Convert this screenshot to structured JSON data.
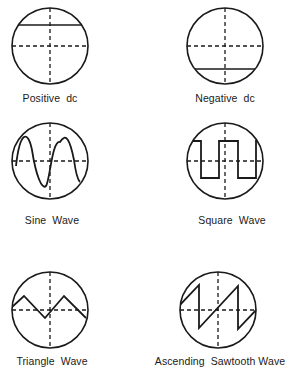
{
  "figure": {
    "panels": [
      {
        "id": "positive-dc",
        "label": "Positive  dc",
        "cx": 50,
        "cy": 46,
        "r": 38,
        "label_x": 50,
        "label_y": 96
      },
      {
        "id": "negative-dc",
        "label": "Negative  dc",
        "cx": 225,
        "cy": 46,
        "r": 38,
        "label_x": 225,
        "label_y": 96
      },
      {
        "id": "sine-wave",
        "label": "Sine  Wave",
        "cx": 50,
        "cy": 161,
        "r": 38,
        "label_x": 52,
        "label_y": 218
      },
      {
        "id": "square-wave",
        "label": "Square  Wave",
        "cx": 225,
        "cy": 161,
        "r": 38,
        "label_x": 232,
        "label_y": 218
      },
      {
        "id": "triangle-wave",
        "label": "Triangle  Wave",
        "cx": 50,
        "cy": 310,
        "r": 38,
        "label_x": 52,
        "label_y": 359
      },
      {
        "id": "sawtooth-wave",
        "label": "Ascending  Sawtooth Wave",
        "cx": 218,
        "cy": 310,
        "r": 38,
        "label_x": 218,
        "label_y": 359
      }
    ]
  },
  "colors": {
    "stroke": "#1a1a1a",
    "background": "#ffffff"
  }
}
